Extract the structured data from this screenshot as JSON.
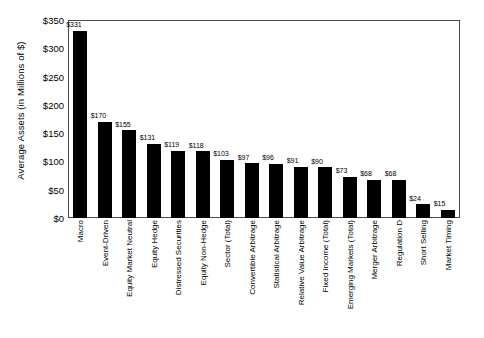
{
  "chart_data": {
    "type": "bar",
    "title": "",
    "xlabel": "",
    "ylabel": "Average Assets (in Millions of $)",
    "ylim": [
      0,
      350
    ],
    "ytick_values": [
      0,
      50,
      100,
      150,
      200,
      250,
      300,
      350
    ],
    "ytick_labels": [
      "$0",
      "$50",
      "$100",
      "$150",
      "$200",
      "$250",
      "$300",
      "$350"
    ],
    "grid": false,
    "legend": null,
    "bar_color": "#000000",
    "value_label_prefix": "$",
    "categories": [
      "Macro",
      "Event-Driven",
      "Equity Market Neutral",
      "Equity Hedge",
      "Distressed Securities",
      "Equity Non-Hedge",
      "Sector (Total)",
      "Convertible Arbitrage",
      "Statistical Arbitrage",
      "Relative Value Arbitrage",
      "Fixed Income (Total)",
      "Emerging Markets (Total)",
      "Merger Arbitrage",
      "Regulation D",
      "Short Selling",
      "Market Timing"
    ],
    "values": [
      331,
      170,
      155,
      131,
      119,
      118,
      103,
      97,
      96,
      91,
      90,
      73,
      68,
      68,
      24,
      15
    ],
    "value_labels": [
      "$331",
      "$170",
      "$155",
      "$131",
      "$119",
      "$118",
      "$103",
      "$97",
      "$96",
      "$91",
      "$90",
      "$73",
      "$68",
      "$68",
      "$24",
      "$15"
    ]
  }
}
